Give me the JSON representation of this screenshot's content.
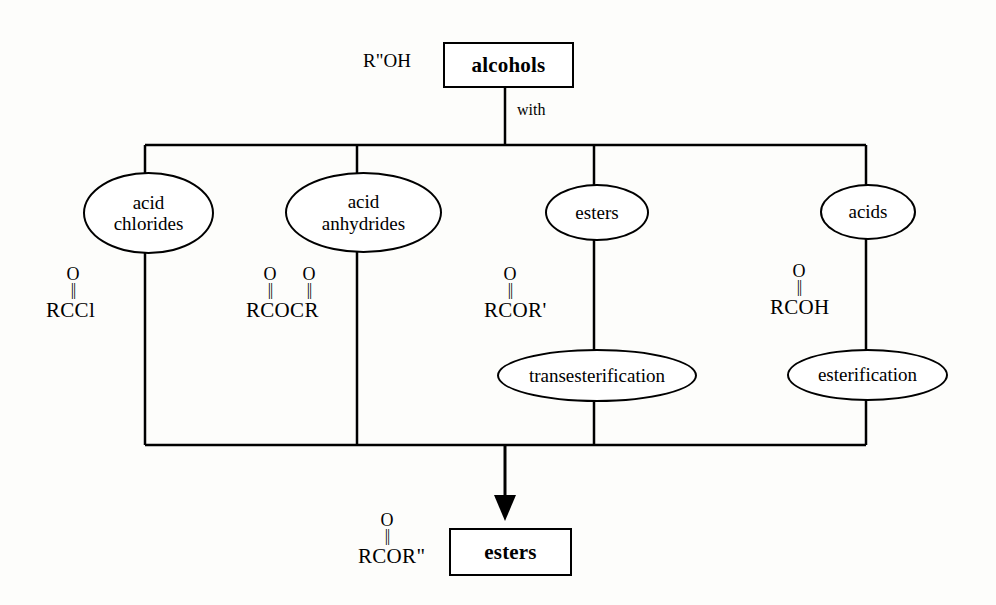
{
  "diagram": {
    "ink_color": "#000000",
    "background_color": "#fdfdfb"
  },
  "top": {
    "reagent_label": "R\"OH",
    "box_label": "alcohols",
    "edge_label": "with"
  },
  "branches": [
    {
      "ellipse_label": "acid\nchlorides",
      "ellipse_line1": "acid",
      "ellipse_line2": "chlorides",
      "formula_base": "RCCl",
      "carbonyl_oxygens": [
        "O"
      ],
      "double_bond_glyph": "||"
    },
    {
      "ellipse_label": "acid\nanhydrides",
      "ellipse_line1": "acid",
      "ellipse_line2": "anhydrides",
      "formula_base": "RCOCR",
      "carbonyl_oxygens": [
        "O",
        "O"
      ],
      "double_bond_glyph": "||"
    },
    {
      "ellipse_label": "esters",
      "ellipse_line1": "esters",
      "ellipse_line2": "",
      "formula_base": "RCOR'",
      "carbonyl_oxygens": [
        "O"
      ],
      "double_bond_glyph": "||",
      "reaction_name": "transesterification"
    },
    {
      "ellipse_label": "acids",
      "ellipse_line1": "acids",
      "ellipse_line2": "",
      "formula_base": "RCOH",
      "carbonyl_oxygens": [
        "O"
      ],
      "double_bond_glyph": "||",
      "reaction_name": "esterification"
    }
  ],
  "reactions": {
    "transesterification": "transesterification",
    "esterification": "esterification"
  },
  "bottom": {
    "product_formula_base": "RCOR\"",
    "product_carbonyl_oxygen": "O",
    "product_double_bond_glyph": "||",
    "box_label": "esters"
  }
}
